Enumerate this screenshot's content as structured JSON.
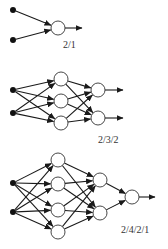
{
  "colors": {
    "background": "#ffffff",
    "edge": "#1a1a1a",
    "node_stroke": "#333333",
    "input_fill": "#111111",
    "label": "#333333"
  },
  "diagrams": [
    {
      "label": "2/1",
      "layers": [
        2,
        1
      ],
      "label_pos": [
        63,
        48
      ],
      "nodes": [
        [
          [
            13,
            10
          ],
          [
            13,
            40
          ]
        ],
        [
          [
            58,
            28
          ]
        ]
      ],
      "output_arrow_end": 82
    },
    {
      "label": "2/3/2",
      "layers": [
        2,
        3,
        2
      ],
      "label_pos": [
        98,
        143
      ],
      "nodes": [
        [
          [
            13,
            90
          ],
          [
            13,
            113
          ]
        ],
        [
          [
            61,
            79
          ],
          [
            61,
            101
          ],
          [
            61,
            123
          ]
        ],
        [
          [
            98,
            90
          ],
          [
            98,
            118
          ]
        ]
      ],
      "output_arrow_end": 123
    },
    {
      "label": "2/4/2/1",
      "layers": [
        2,
        4,
        2,
        1
      ],
      "label_pos": [
        121,
        233
      ],
      "nodes": [
        [
          [
            13,
            183
          ],
          [
            13,
            212
          ]
        ],
        [
          [
            58,
            160
          ],
          [
            58,
            184
          ],
          [
            58,
            210
          ],
          [
            58,
            232
          ]
        ],
        [
          [
            100,
            180
          ],
          [
            100,
            213
          ]
        ],
        [
          [
            132,
            197
          ]
        ]
      ],
      "output_arrow_end": 155
    }
  ],
  "node_radius": 7,
  "input_radius": 3
}
